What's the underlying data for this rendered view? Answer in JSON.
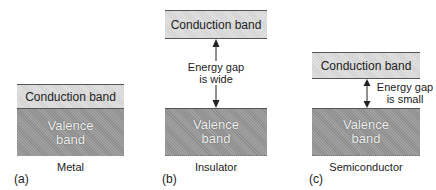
{
  "panels": [
    {
      "id": "a",
      "label": "(a)",
      "caption": "Metal",
      "conduction": "Conduction band",
      "valence_line1": "Valence",
      "valence_line2": "band"
    },
    {
      "id": "b",
      "label": "(b)",
      "caption": "Insulator",
      "conduction": "Conduction band",
      "valence_line1": "Valence",
      "valence_line2": "band",
      "gap_line1": "Energy gap",
      "gap_line2": "is wide"
    },
    {
      "id": "c",
      "label": "(c)",
      "caption": "Semiconductor",
      "conduction": "Conduction band",
      "valence_line1": "Valence",
      "valence_line2": "band",
      "gap_line1": "Energy gap",
      "gap_line2": "is small"
    }
  ],
  "colors": {
    "conduction_band": "#d2d2d2",
    "valence_band": "#8e8e8e",
    "border": "#555555"
  }
}
